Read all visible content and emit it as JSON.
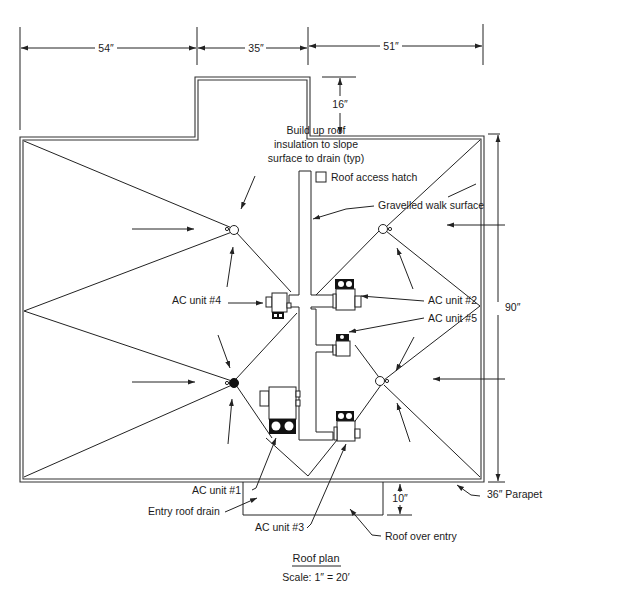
{
  "diagram": {
    "title": "Roof plan",
    "scale": "Scale: 1″ = 20′",
    "dimensions": {
      "top_left": "54″",
      "top_middle": "35″",
      "top_right": "51″",
      "bump_height": "16″",
      "overall_height": "90″",
      "entry_depth": "10″"
    },
    "notes": {
      "insulation_line1": "Build up roof",
      "insulation_line2": "insulation to slope",
      "insulation_line3": "surface to drain (typ)",
      "hatch": "Roof access hatch",
      "walk": "Gravelled walk surface",
      "parapet": "36″ Parapet",
      "entry_drain": "Entry roof drain",
      "roof_over_entry": "Roof over entry"
    },
    "ac_units": [
      {
        "label": "AC unit #1"
      },
      {
        "label": "AC unit #2"
      },
      {
        "label": "AC unit #3"
      },
      {
        "label": "AC unit #4"
      },
      {
        "label": "AC unit #5"
      }
    ],
    "colors": {
      "line": "#222222",
      "background": "#ffffff"
    }
  }
}
